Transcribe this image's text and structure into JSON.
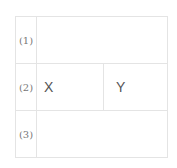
{
  "rows": [
    {
      "label": "(1)"
    },
    {
      "label": "(2)",
      "cells": [
        "X",
        "Y"
      ]
    },
    {
      "label": "(3)"
    }
  ]
}
